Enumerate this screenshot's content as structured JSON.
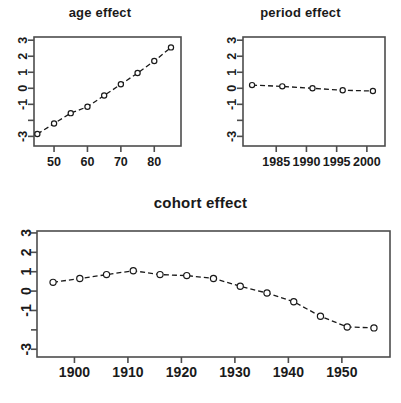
{
  "figure": {
    "background": "#ffffff",
    "foreground": "#1a1a1a",
    "frame_color": "#4d4d4d"
  },
  "panels": {
    "age": {
      "title": "age effect"
    },
    "period": {
      "title": "period effect"
    },
    "cohort": {
      "title": "cohort effect"
    }
  },
  "chart_data": [
    {
      "type": "line",
      "title": "age effect",
      "xlabel": "",
      "ylabel": "",
      "grid": false,
      "legend": "none",
      "marker": "open-circle",
      "linestyle": "dashed",
      "xlim": [
        44,
        88
      ],
      "ylim": [
        -3.6,
        3.2
      ],
      "xticks": [
        50,
        60,
        70,
        80
      ],
      "xtick_labels": [
        "50",
        "60",
        "70",
        "80"
      ],
      "yticks": [
        -3,
        -2,
        -1,
        0,
        1,
        2,
        3
      ],
      "ytick_labels": [
        "-3",
        "",
        "-1",
        "0",
        "1",
        "2",
        "3"
      ],
      "x": [
        45,
        50,
        55,
        60,
        65,
        70,
        75,
        80,
        85
      ],
      "values": [
        -2.85,
        -2.2,
        -1.55,
        -1.15,
        -0.45,
        0.25,
        0.95,
        1.7,
        2.55
      ]
    },
    {
      "type": "line",
      "title": "period effect",
      "xlabel": "",
      "ylabel": "",
      "grid": false,
      "legend": "none",
      "marker": "open-circle",
      "linestyle": "dashed",
      "xlim": [
        1979.5,
        2003
      ],
      "ylim": [
        -3.6,
        3.2
      ],
      "xticks": [
        1985,
        1990,
        1995,
        2000
      ],
      "xtick_labels": [
        "1985",
        "1990",
        "1995",
        "2000"
      ],
      "yticks": [
        -3,
        -2,
        -1,
        0,
        1,
        2,
        3
      ],
      "ytick_labels": [
        "-3",
        "",
        "-1",
        "0",
        "1",
        "2",
        "3"
      ],
      "x": [
        1981,
        1986,
        1991,
        1996,
        2001
      ],
      "values": [
        0.2,
        0.12,
        0.0,
        -0.12,
        -0.17
      ]
    },
    {
      "type": "line",
      "title": "cohort effect",
      "xlabel": "",
      "ylabel": "",
      "grid": false,
      "legend": "none",
      "marker": "open-circle",
      "linestyle": "dashed",
      "xlim": [
        1893,
        1959
      ],
      "ylim": [
        -3.4,
        3.1
      ],
      "xticks": [
        1900,
        1910,
        1920,
        1930,
        1940,
        1950
      ],
      "xtick_labels": [
        "1900",
        "1910",
        "1920",
        "1930",
        "1940",
        "1950"
      ],
      "yticks": [
        -3,
        -2,
        -1,
        0,
        1,
        2,
        3
      ],
      "ytick_labels": [
        "-3",
        "",
        "-1",
        "0",
        "1",
        "2",
        "3"
      ],
      "x": [
        1896,
        1901,
        1906,
        1911,
        1916,
        1921,
        1926,
        1931,
        1936,
        1941,
        1946,
        1951,
        1956
      ],
      "values": [
        0.45,
        0.65,
        0.85,
        1.05,
        0.85,
        0.8,
        0.65,
        0.25,
        -0.1,
        -0.55,
        -1.3,
        -1.85,
        -1.9
      ]
    }
  ]
}
